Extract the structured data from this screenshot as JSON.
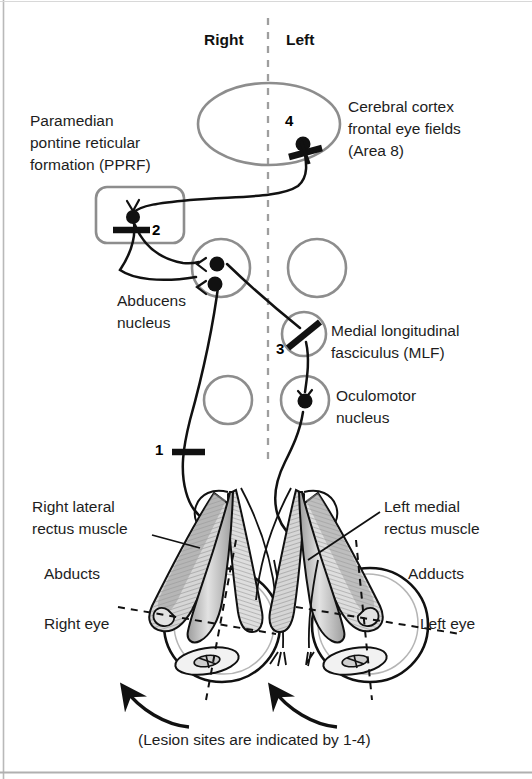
{
  "figure": {
    "type": "anatomical-diagram",
    "caption": "(Lesion sites are indicated by 1-4)"
  },
  "headers": {
    "right": "Right",
    "left": "Left"
  },
  "labels": {
    "pprf_line1": "Paramedian",
    "pprf_line2": "pontine reticular",
    "pprf_line3": "formation (PPRF)",
    "cortex_line1": "Cerebral cortex",
    "cortex_line2": "frontal eye fields",
    "cortex_line3": "(Area 8)",
    "abducens_line1": "Abducens",
    "abducens_line2": "nucleus",
    "mlf_line1": "Medial longitudinal",
    "mlf_line2": "fasciculus (MLF)",
    "oculomotor_line1": "Oculomotor",
    "oculomotor_line2": "nucleus",
    "right_lateral_line1": "Right lateral",
    "right_lateral_line2": "rectus muscle",
    "left_medial_line1": "Left medial",
    "left_medial_line2": "rectus muscle",
    "abducts": "Abducts",
    "adducts": "Adducts",
    "right_eye": "Right eye",
    "left_eye": "Left eye"
  },
  "lesions": [
    {
      "id": "1",
      "label": "1",
      "site": "right abducens nerve (CN VI)"
    },
    {
      "id": "2",
      "label": "2",
      "site": "paramedian pontine reticular formation"
    },
    {
      "id": "3",
      "label": "3",
      "site": "left medial longitudinal fasciculus"
    },
    {
      "id": "4",
      "label": "4",
      "site": "left frontal eye field"
    }
  ],
  "colors": {
    "ink": "#1a1a1a",
    "structure_outline": "#8a8a8a",
    "midline": "#9a9a9a",
    "muscle_fill": "#cfcfcf",
    "muscle_dark": "#6d6d6d",
    "background": "#ffffff"
  },
  "icons": {
    "midline": "dashed-midline-icon",
    "lesion_mark": "lesion-slash-icon",
    "synapse": "synapse-dot-icon",
    "gaze_arrow": "curved-gaze-arrow-icon"
  }
}
